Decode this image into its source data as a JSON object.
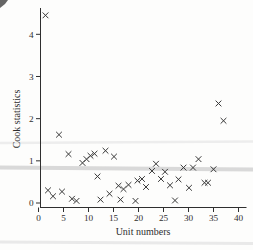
{
  "figure": {
    "width_px": 253,
    "height_px": 250,
    "background": "#fdfdfc",
    "ink_color": "#2f2f2f",
    "marker_color": "#383838"
  },
  "chart_data": {
    "type": "scatter",
    "title": "",
    "xlabel": "Unit numbers",
    "ylabel": "Cook statistics",
    "xlim": [
      0,
      41.5
    ],
    "ylim": [
      0,
      4.7
    ],
    "x_ticks": [
      0,
      5,
      10,
      15,
      20,
      25,
      30,
      35,
      40
    ],
    "y_ticks": [
      0,
      1,
      2,
      3,
      4
    ],
    "grid": false,
    "legend": null,
    "marker": "x",
    "points": [
      [
        1.4,
        4.45
      ],
      [
        1.9,
        0.3
      ],
      [
        2.9,
        0.16
      ],
      [
        4.1,
        1.62
      ],
      [
        4.7,
        0.27
      ],
      [
        6.0,
        1.16
      ],
      [
        6.7,
        0.1
      ],
      [
        7.6,
        0.05
      ],
      [
        8.8,
        0.95
      ],
      [
        9.6,
        1.04
      ],
      [
        10.4,
        1.12
      ],
      [
        11.2,
        1.17
      ],
      [
        11.8,
        0.63
      ],
      [
        12.4,
        0.08
      ],
      [
        13.4,
        1.24
      ],
      [
        14.2,
        0.22
      ],
      [
        15.1,
        1.1
      ],
      [
        16.0,
        0.41
      ],
      [
        16.4,
        0.08
      ],
      [
        17.0,
        0.33
      ],
      [
        18.0,
        0.43
      ],
      [
        19.4,
        0.05
      ],
      [
        19.8,
        0.53
      ],
      [
        20.7,
        0.57
      ],
      [
        21.5,
        0.38
      ],
      [
        22.7,
        0.76
      ],
      [
        23.5,
        0.93
      ],
      [
        24.5,
        0.57
      ],
      [
        25.3,
        0.74
      ],
      [
        26.3,
        0.42
      ],
      [
        27.3,
        0.06
      ],
      [
        28.0,
        0.56
      ],
      [
        29.0,
        0.84
      ],
      [
        30.1,
        0.36
      ],
      [
        30.9,
        0.84
      ],
      [
        32.0,
        1.04
      ],
      [
        33.2,
        0.48
      ],
      [
        33.9,
        0.48
      ],
      [
        35.0,
        0.8
      ],
      [
        36.0,
        2.36
      ],
      [
        37.0,
        1.95
      ]
    ]
  },
  "scan_artifacts": {
    "horizontal_lines": [
      {
        "y_value": 1.44,
        "color": "#ededed",
        "thickness_px": 2.5,
        "tilt_px": -1.5
      },
      {
        "y_value": 0.82,
        "color": "#d9d9d9",
        "thickness_px": 4,
        "tilt_px": 2
      }
    ],
    "bottom_band": {
      "color": "#e9e9e9",
      "thickness_px": 3
    },
    "corner_mark": {
      "color": "#4a4a4a"
    }
  }
}
